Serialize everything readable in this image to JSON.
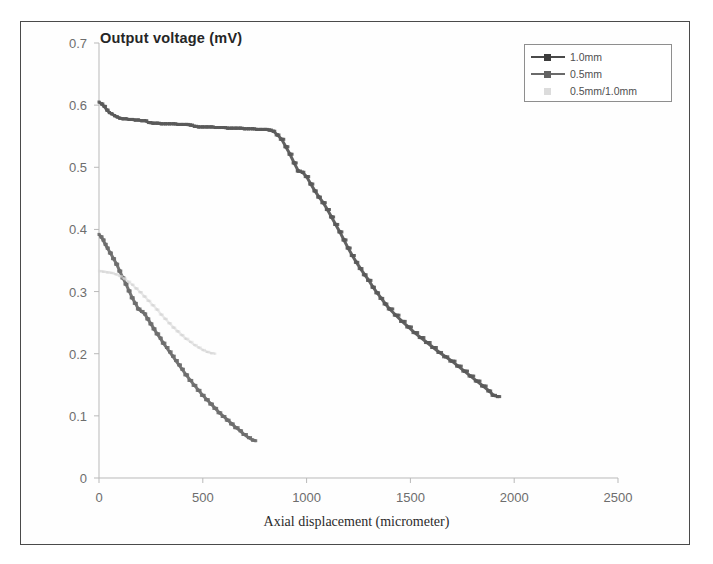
{
  "figure": {
    "background_color": "#ffffff",
    "frame_color": "#4a4a4a"
  },
  "chart_data": {
    "type": "line",
    "title": "",
    "subtitle": "",
    "xlabel": "Axial displacement (micrometer)",
    "ylabel": "Output voltage (mV)",
    "xlim": [
      0,
      2500
    ],
    "ylim": [
      0,
      0.7
    ],
    "xticks": [
      0,
      500,
      1000,
      1500,
      2000,
      2500
    ],
    "yticks": [
      0,
      0.1,
      0.2,
      0.3,
      0.4,
      0.5,
      0.6,
      0.7
    ],
    "xtick_labels": [
      "0",
      "500",
      "1000",
      "1500",
      "2000",
      "2500"
    ],
    "ytick_labels": [
      "0",
      "0.1",
      "0.2",
      "0.3",
      "0.4",
      "0.5",
      "0.6",
      "0.7"
    ],
    "grid": false,
    "legend_position": "top-right",
    "marker": "square",
    "series": [
      {
        "name": "1.0mm",
        "color": "#5a5a5a",
        "x": [
          0,
          12,
          25,
          38,
          50,
          62,
          75,
          88,
          100,
          115,
          130,
          145,
          160,
          175,
          190,
          205,
          220,
          240,
          260,
          280,
          300,
          320,
          340,
          360,
          380,
          400,
          420,
          440,
          460,
          480,
          500,
          520,
          540,
          560,
          580,
          600,
          620,
          640,
          660,
          680,
          700,
          720,
          740,
          760,
          780,
          800,
          820,
          840,
          860,
          880,
          900,
          920,
          940,
          960,
          980,
          1000,
          1020,
          1040,
          1060,
          1080,
          1100,
          1120,
          1140,
          1160,
          1180,
          1200,
          1220,
          1240,
          1260,
          1280,
          1300,
          1320,
          1340,
          1360,
          1380,
          1400,
          1430,
          1460,
          1490,
          1520,
          1550,
          1580,
          1610,
          1640,
          1670,
          1700,
          1730,
          1760,
          1790,
          1820,
          1850,
          1880,
          1900,
          1920,
          1930
        ],
        "y": [
          0.605,
          0.602,
          0.598,
          0.592,
          0.588,
          0.586,
          0.583,
          0.581,
          0.579,
          0.578,
          0.578,
          0.577,
          0.577,
          0.576,
          0.576,
          0.575,
          0.575,
          0.572,
          0.571,
          0.571,
          0.57,
          0.57,
          0.57,
          0.57,
          0.569,
          0.569,
          0.569,
          0.568,
          0.566,
          0.565,
          0.565,
          0.565,
          0.565,
          0.564,
          0.564,
          0.564,
          0.563,
          0.563,
          0.563,
          0.563,
          0.562,
          0.562,
          0.562,
          0.561,
          0.561,
          0.561,
          0.56,
          0.558,
          0.552,
          0.545,
          0.533,
          0.521,
          0.507,
          0.494,
          0.492,
          0.485,
          0.473,
          0.462,
          0.452,
          0.443,
          0.432,
          0.42,
          0.408,
          0.396,
          0.383,
          0.37,
          0.358,
          0.347,
          0.337,
          0.327,
          0.318,
          0.307,
          0.298,
          0.289,
          0.28,
          0.272,
          0.262,
          0.252,
          0.243,
          0.234,
          0.226,
          0.218,
          0.21,
          0.202,
          0.195,
          0.188,
          0.18,
          0.172,
          0.164,
          0.156,
          0.148,
          0.14,
          0.133,
          0.131,
          0.131
        ]
      },
      {
        "name": "0.5mm",
        "color": "#6e6e6e",
        "x": [
          0,
          10,
          20,
          30,
          40,
          55,
          70,
          85,
          100,
          115,
          130,
          145,
          160,
          175,
          190,
          205,
          220,
          235,
          250,
          265,
          280,
          295,
          310,
          325,
          340,
          355,
          370,
          385,
          400,
          420,
          440,
          460,
          480,
          500,
          520,
          540,
          560,
          580,
          600,
          620,
          640,
          660,
          680,
          700,
          720,
          740,
          755
        ],
        "y": [
          0.392,
          0.388,
          0.383,
          0.376,
          0.37,
          0.362,
          0.353,
          0.344,
          0.333,
          0.322,
          0.312,
          0.301,
          0.29,
          0.281,
          0.272,
          0.268,
          0.264,
          0.256,
          0.248,
          0.24,
          0.232,
          0.225,
          0.217,
          0.21,
          0.203,
          0.196,
          0.189,
          0.182,
          0.175,
          0.166,
          0.157,
          0.149,
          0.141,
          0.133,
          0.126,
          0.119,
          0.112,
          0.105,
          0.099,
          0.093,
          0.087,
          0.081,
          0.076,
          0.07,
          0.065,
          0.061,
          0.06
        ]
      },
      {
        "name": "0.5mm/1.0mm",
        "color": "#d5d5d5",
        "x": [
          0,
          20,
          40,
          60,
          80,
          100,
          120,
          140,
          160,
          180,
          200,
          220,
          240,
          260,
          280,
          300,
          320,
          340,
          360,
          380,
          400,
          420,
          440,
          460,
          480,
          500,
          520,
          540,
          560
        ],
        "y": [
          0.333,
          0.332,
          0.331,
          0.33,
          0.328,
          0.325,
          0.321,
          0.316,
          0.311,
          0.305,
          0.299,
          0.292,
          0.285,
          0.278,
          0.271,
          0.263,
          0.256,
          0.249,
          0.242,
          0.236,
          0.23,
          0.224,
          0.219,
          0.214,
          0.21,
          0.206,
          0.203,
          0.201,
          0.2
        ]
      }
    ]
  },
  "legend": {
    "entries": [
      {
        "label": "1.0mm",
        "color": "#4a4a4a",
        "has_line": true,
        "has_marker": true
      },
      {
        "label": "0.5mm",
        "color": "#6a6a6a",
        "has_line": true,
        "has_marker": true
      },
      {
        "label": "0.5mm/1.0mm",
        "color": "#dddddd",
        "has_line": false,
        "has_marker": true
      }
    ]
  }
}
